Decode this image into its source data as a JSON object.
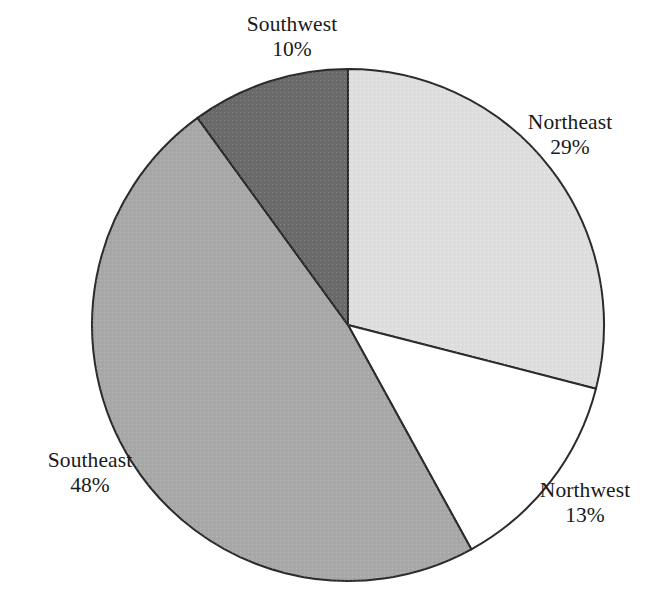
{
  "chart_data": {
    "type": "pie",
    "title": "",
    "subtitle": "",
    "xlabel": "",
    "ylabel": "",
    "grid": false,
    "legend_position": "none",
    "label_format": "name + percent",
    "start_angle_deg": 0,
    "direction": "clockwise",
    "units": "percent",
    "total": 100,
    "categories": [
      "Northeast",
      "Northwest",
      "Southeast",
      "Southwest"
    ],
    "values": [
      29,
      13,
      48,
      10
    ],
    "slices": [
      {
        "name": "Northeast",
        "value": 29,
        "value_label": "29%",
        "color": "#dedede",
        "start_angle_deg": 0,
        "end_angle_deg": 104.4,
        "label_position": "outside-right-upper"
      },
      {
        "name": "Northwest",
        "value": 13,
        "value_label": "13%",
        "color": "#ffffff",
        "start_angle_deg": 104.4,
        "end_angle_deg": 151.2,
        "label_position": "outside-right-lower"
      },
      {
        "name": "Southeast",
        "value": 48,
        "value_label": "48%",
        "color": "#a8a8a8",
        "start_angle_deg": 151.2,
        "end_angle_deg": 324.0,
        "label_position": "outside-left-lower"
      },
      {
        "name": "Southwest",
        "value": 10,
        "value_label": "10%",
        "color": "#6a6a6a",
        "start_angle_deg": 324.0,
        "end_angle_deg": 360.0,
        "label_position": "outside-top"
      }
    ],
    "geometry": {
      "center_x": 348,
      "center_y": 325,
      "radius": 256,
      "stroke_color": "#2b2b2b",
      "stroke_width": 2,
      "background": "#ffffff"
    }
  },
  "labels": {
    "northeast": {
      "name": "Northeast",
      "value": "29%"
    },
    "northwest": {
      "name": "Northwest",
      "value": "13%"
    },
    "southeast": {
      "name": "Southeast",
      "value": "48%"
    },
    "southwest": {
      "name": "Southwest",
      "value": "10%"
    }
  }
}
